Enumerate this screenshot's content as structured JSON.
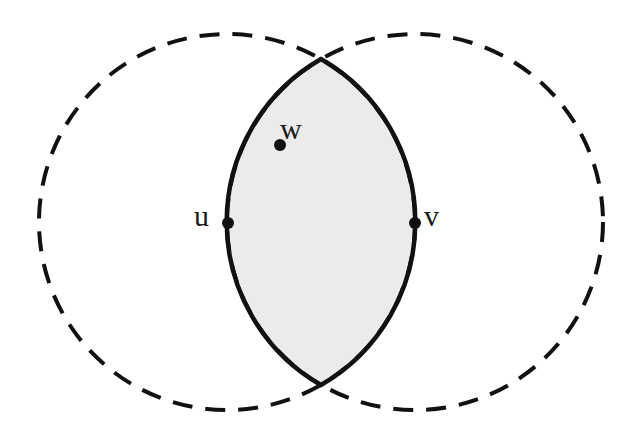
{
  "diagram": {
    "colors": {
      "background": "#ffffff",
      "lens_fill": "#ebebeb",
      "stroke": "#111111"
    },
    "circles": [
      {
        "name": "left-circle",
        "cx": 227,
        "cy": 222,
        "r": 188,
        "style": "dashed"
      },
      {
        "name": "right-circle",
        "cx": 415,
        "cy": 222,
        "r": 188,
        "style": "dashed"
      }
    ],
    "lens": {
      "top": {
        "x": 321,
        "y": 59
      },
      "bottom": {
        "x": 321,
        "y": 385
      }
    },
    "points": [
      {
        "id": "u",
        "label": "u",
        "x": 227,
        "y": 222
      },
      {
        "id": "v",
        "label": "v",
        "x": 415,
        "y": 222
      },
      {
        "id": "w",
        "label": "w",
        "x": 280,
        "y": 145
      }
    ]
  }
}
